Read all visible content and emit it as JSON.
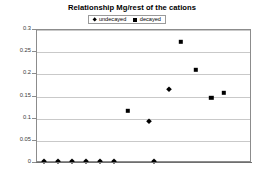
{
  "chart_data": {
    "type": "scatter",
    "title": "Relationship Mg/rest of the cations",
    "xlabel": "",
    "ylabel": "",
    "ylim": [
      0,
      0.3
    ],
    "xlim": [
      0,
      20
    ],
    "grid": true,
    "legend_position": "top-center",
    "yticks": [
      "0",
      "0.05",
      "0.1",
      "0.15",
      "0.2",
      "0.25",
      "0.3"
    ],
    "ytick_values": [
      0,
      0.05,
      0.1,
      0.15,
      0.2,
      0.25,
      0.3
    ],
    "xticks": [],
    "series": [
      {
        "name": "undecayed",
        "marker": "diamond",
        "color": "#000000",
        "points": [
          {
            "x": 0.65,
            "y": 0.005
          },
          {
            "x": 1.95,
            "y": 0.005
          },
          {
            "x": 3.25,
            "y": 0.005
          },
          {
            "x": 4.55,
            "y": 0.005
          },
          {
            "x": 5.85,
            "y": 0.005
          },
          {
            "x": 7.15,
            "y": 0.005
          },
          {
            "x": 10.4,
            "y": 0.095
          },
          {
            "x": 10.9,
            "y": 0.005
          },
          {
            "x": 12.3,
            "y": 0.167
          }
        ]
      },
      {
        "name": "decayed",
        "marker": "square",
        "color": "#000000",
        "points": [
          {
            "x": 8.45,
            "y": 0.118
          },
          {
            "x": 13.4,
            "y": 0.273
          },
          {
            "x": 14.8,
            "y": 0.21
          },
          {
            "x": 16.2,
            "y": 0.147
          },
          {
            "x": 17.4,
            "y": 0.158
          }
        ]
      }
    ]
  },
  "legend": {
    "items": [
      {
        "label": "undecayed",
        "marker": "diamond"
      },
      {
        "label": "decayed",
        "marker": "square"
      }
    ]
  },
  "colors": {
    "marker": "#000000",
    "gridline": "#c9c9c9",
    "axis": "#8c8c8c",
    "background": "#ffffff"
  }
}
